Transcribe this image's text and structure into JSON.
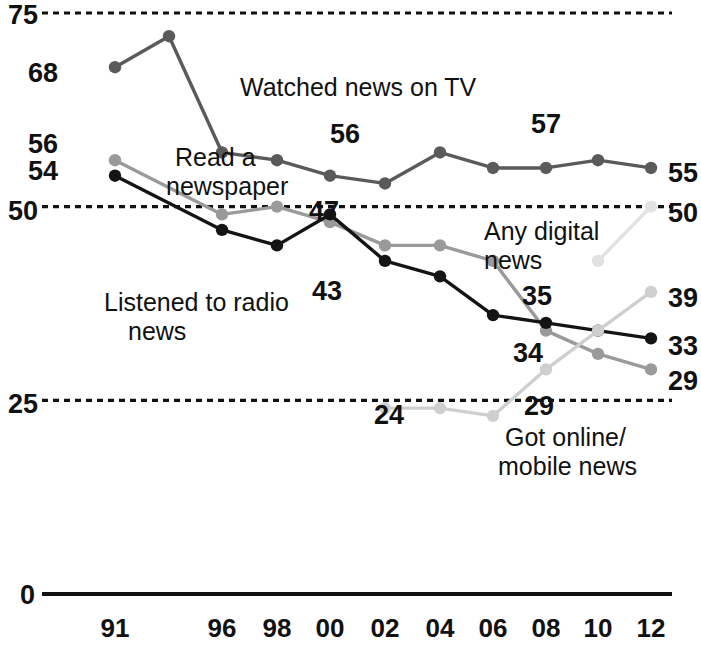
{
  "chart_data": {
    "type": "line",
    "title": "",
    "subtitle": "",
    "xlabel": "",
    "ylabel": "",
    "xlim": [
      1991,
      2012
    ],
    "ylim": [
      0,
      75
    ],
    "grid": true,
    "grid_values": [
      75,
      50,
      25
    ],
    "grid_style": "dashed",
    "legend_position": "inline-annotations",
    "x": [
      1991,
      1993,
      1996,
      1998,
      2000,
      2002,
      2004,
      2006,
      2008,
      2010,
      2012
    ],
    "tick_labels_x": [
      "91",
      "96",
      "98",
      "00",
      "02",
      "04",
      "06",
      "08",
      "10",
      "12"
    ],
    "tick_values_x": [
      1991,
      1996,
      1998,
      2000,
      2002,
      2004,
      2006,
      2008,
      2010,
      2012
    ],
    "tick_labels_y": [
      "75",
      "68",
      "56",
      "54",
      "50",
      "25",
      "0"
    ],
    "tick_values_y": [
      75,
      68,
      56,
      54,
      50,
      25,
      0
    ],
    "series": [
      {
        "name": "Watched news on TV",
        "color": "#5a5a5a",
        "points": [
          {
            "x": 1991,
            "y": 68
          },
          {
            "x": 1993,
            "y": 72
          },
          {
            "x": 1996,
            "y": 57
          },
          {
            "x": 1998,
            "y": 56
          },
          {
            "x": 2000,
            "y": 54
          },
          {
            "x": 2002,
            "y": 53
          },
          {
            "x": 2004,
            "y": 57
          },
          {
            "x": 2006,
            "y": 55
          },
          {
            "x": 2008,
            "y": 55
          },
          {
            "x": 2010,
            "y": 56
          },
          {
            "x": 2012,
            "y": 55
          }
        ]
      },
      {
        "name": "Read a newspaper",
        "color": "#9a9a9a",
        "points": [
          {
            "x": 1991,
            "y": 56
          },
          {
            "x": 1996,
            "y": 49
          },
          {
            "x": 1998,
            "y": 50
          },
          {
            "x": 2000,
            "y": 48
          },
          {
            "x": 2002,
            "y": 45
          },
          {
            "x": 2004,
            "y": 45
          },
          {
            "x": 2006,
            "y": 43
          },
          {
            "x": 2008,
            "y": 34
          },
          {
            "x": 2010,
            "y": 31
          },
          {
            "x": 2012,
            "y": 29
          }
        ]
      },
      {
        "name": "Listened to radio news",
        "color": "#141414",
        "points": [
          {
            "x": 1991,
            "y": 54
          },
          {
            "x": 1996,
            "y": 47
          },
          {
            "x": 1998,
            "y": 45
          },
          {
            "x": 2000,
            "y": 49
          },
          {
            "x": 2002,
            "y": 43
          },
          {
            "x": 2004,
            "y": 41
          },
          {
            "x": 2006,
            "y": 36
          },
          {
            "x": 2008,
            "y": 35
          },
          {
            "x": 2010,
            "y": 34
          },
          {
            "x": 2012,
            "y": 33
          }
        ]
      },
      {
        "name": "Got online/mobile news",
        "color": "#cfcfcf",
        "points": [
          {
            "x": 2002,
            "y": 24
          },
          {
            "x": 2004,
            "y": 24
          },
          {
            "x": 2006,
            "y": 23
          },
          {
            "x": 2008,
            "y": 29
          },
          {
            "x": 2010,
            "y": 34
          },
          {
            "x": 2012,
            "y": 39
          }
        ]
      },
      {
        "name": "Any digital news",
        "color": "#e2e2e2",
        "points": [
          {
            "x": 2010,
            "y": 43
          },
          {
            "x": 2012,
            "y": 50
          }
        ]
      }
    ],
    "annotations": [
      {
        "text": "Watched news on TV",
        "x": 240,
        "y": 96,
        "name": "annotation-watched-news-on-tv"
      },
      {
        "text": "Read a",
        "x": 175,
        "y": 166,
        "name": "annotation-read-a-newspaper-line1"
      },
      {
        "text": "newspaper",
        "x": 166,
        "y": 195,
        "name": "annotation-read-a-newspaper-line2"
      },
      {
        "text": "Listened to radio",
        "x": 104,
        "y": 311,
        "name": "annotation-listened-to-radio-news-line1"
      },
      {
        "text": "news",
        "x": 128,
        "y": 340,
        "name": "annotation-listened-to-radio-news-line2"
      },
      {
        "text": "Any digital",
        "x": 484,
        "y": 240,
        "name": "annotation-any-digital-news-line1"
      },
      {
        "text": "news",
        "x": 484,
        "y": 269,
        "name": "annotation-any-digital-news-line2"
      },
      {
        "text": "Got online/",
        "x": 505,
        "y": 446,
        "name": "annotation-got-online-mobile-news-line1"
      },
      {
        "text": "mobile news",
        "x": 498,
        "y": 475,
        "name": "annotation-got-online-mobile-news-line2"
      }
    ],
    "data_labels": [
      {
        "text": "56",
        "x": 330,
        "y": 143,
        "name": "data-label-tv-56"
      },
      {
        "text": "57",
        "x": 531,
        "y": 133,
        "name": "data-label-tv-57"
      },
      {
        "text": "47",
        "x": 309,
        "y": 220,
        "name": "data-label-radio-47"
      },
      {
        "text": "43",
        "x": 312,
        "y": 300,
        "name": "data-label-radio-43"
      },
      {
        "text": "35",
        "x": 522,
        "y": 305,
        "name": "data-label-newspaper-35"
      },
      {
        "text": "34",
        "x": 513,
        "y": 362,
        "name": "data-label-radio-34"
      },
      {
        "text": "24",
        "x": 374,
        "y": 424,
        "name": "data-label-online-24"
      },
      {
        "text": "29",
        "x": 524,
        "y": 415,
        "name": "data-label-online-29"
      }
    ],
    "end_labels": [
      {
        "text": "55",
        "x": 668,
        "y": 182,
        "name": "end-label-tv-55"
      },
      {
        "text": "50",
        "x": 668,
        "y": 222,
        "name": "end-label-any-digital-50"
      },
      {
        "text": "39",
        "x": 668,
        "y": 307,
        "name": "end-label-online-39"
      },
      {
        "text": "33",
        "x": 668,
        "y": 355,
        "name": "end-label-radio-33"
      },
      {
        "text": "29",
        "x": 668,
        "y": 390,
        "name": "end-label-newspaper-29"
      }
    ],
    "y_axis_labels": [
      {
        "text": "75",
        "x": 8,
        "y": 24,
        "name": "y-axis-label-75"
      },
      {
        "text": "68",
        "x": 28,
        "y": 82,
        "name": "y-axis-label-68"
      },
      {
        "text": "56",
        "x": 28,
        "y": 153,
        "name": "y-axis-label-56"
      },
      {
        "text": "54",
        "x": 28,
        "y": 180,
        "name": "y-axis-label-54"
      },
      {
        "text": "50",
        "x": 8,
        "y": 220,
        "name": "y-axis-label-50"
      },
      {
        "text": "25",
        "x": 8,
        "y": 413,
        "name": "y-axis-label-25"
      },
      {
        "text": "0",
        "x": 20,
        "y": 604,
        "name": "y-axis-label-0"
      }
    ],
    "x_axis_labels": [
      {
        "text": "91",
        "x": 115,
        "name": "x-axis-label-91"
      },
      {
        "text": "96",
        "x": 222,
        "name": "x-axis-label-96"
      },
      {
        "text": "98",
        "x": 277,
        "name": "x-axis-label-98"
      },
      {
        "text": "00",
        "x": 330,
        "name": "x-axis-label-00"
      },
      {
        "text": "02",
        "x": 385,
        "name": "x-axis-label-02"
      },
      {
        "text": "04",
        "x": 440,
        "name": "x-axis-label-04"
      },
      {
        "text": "06",
        "x": 493,
        "name": "x-axis-label-06"
      },
      {
        "text": "08",
        "x": 546,
        "name": "x-axis-label-08"
      },
      {
        "text": "10",
        "x": 598,
        "name": "x-axis-label-10"
      },
      {
        "text": "12",
        "x": 651,
        "name": "x-axis-label-12"
      }
    ]
  },
  "colors": {
    "tv": "#5a5a5a",
    "newspaper": "#9a9a9a",
    "radio": "#141414",
    "online": "#cfcfcf",
    "any_digital": "#e2e2e2",
    "axis": "#111111",
    "grid": "#111111",
    "background": "#ffffff"
  }
}
